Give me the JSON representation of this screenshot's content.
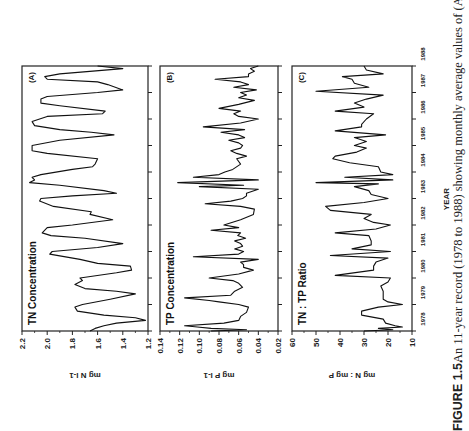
{
  "figure": {
    "caption_label": "FIGURE 1.5.",
    "caption_text": "An 11-year record (1978 to 1988) showing monthly average values of (A)",
    "x_axis_title": "YEAR"
  },
  "chart_data": [
    {
      "type": "line",
      "panel": "(A)",
      "title": "TN Concentration",
      "xlabel": "YEAR",
      "ylabel": "mg N l-1",
      "ylim": [
        1.2,
        2.2
      ],
      "yticks": [
        "1.2",
        "1.4",
        "1.6",
        "1.8",
        "2.0",
        "2.2"
      ],
      "xticks": [
        "1978",
        "1979",
        "1980",
        "1981",
        "1982",
        "1983",
        "1984",
        "1985",
        "1986",
        "1987",
        "1988"
      ],
      "grid": false,
      "x": [
        1978.0,
        1978.1,
        1978.2,
        1978.3,
        1978.4,
        1978.5,
        1978.6,
        1978.75,
        1978.9,
        1979.0,
        1979.2,
        1979.4,
        1979.5,
        1979.6,
        1979.75,
        1979.9,
        1980.0,
        1980.2,
        1980.3,
        1980.45,
        1980.55,
        1980.7,
        1980.9,
        1981.0,
        1981.15,
        1981.3,
        1981.5,
        1981.6,
        1981.7,
        1981.9,
        1982.0,
        1982.2,
        1982.4,
        1982.5,
        1982.7,
        1982.9,
        1983.0,
        1983.1,
        1983.2,
        1983.3,
        1983.5,
        1983.6,
        1983.7,
        1983.8,
        1983.9,
        1984.1,
        1984.2,
        1984.3,
        1984.5,
        1984.7,
        1984.8,
        1985.0,
        1985.2,
        1985.4,
        1985.5,
        1985.6,
        1985.75,
        1985.9,
        1986.1,
        1986.2,
        1986.3,
        1986.5,
        1986.6,
        1986.75,
        1986.85,
        1987.0,
        1987.1,
        1987.3,
        1987.4,
        1987.5,
        1987.6,
        1987.7,
        1987.9,
        1988.0
      ],
      "values": [
        1.66,
        1.62,
        1.55,
        1.45,
        1.22,
        1.3,
        1.55,
        1.76,
        1.78,
        1.72,
        1.5,
        1.3,
        1.45,
        1.7,
        1.78,
        1.72,
        1.74,
        1.45,
        1.33,
        1.34,
        1.6,
        1.74,
        1.98,
        1.96,
        1.6,
        1.4,
        1.7,
        1.97,
        2.04,
        2.0,
        1.8,
        1.48,
        1.66,
        1.65,
        1.95,
        2.06,
        2.05,
        1.8,
        1.45,
        1.55,
        1.9,
        2.14,
        2.1,
        2.12,
        2.05,
        1.8,
        1.64,
        1.62,
        1.6,
        2.0,
        2.12,
        2.12,
        1.9,
        1.47,
        1.65,
        1.9,
        2.1,
        2.12,
        2.0,
        1.56,
        1.54,
        1.9,
        2.05,
        2.05,
        2.0,
        1.6,
        1.4,
        1.52,
        1.6,
        2.0,
        2.02,
        1.9,
        1.4,
        1.6
      ]
    },
    {
      "type": "line",
      "panel": "(B)",
      "title": "TP Concentration",
      "xlabel": "YEAR",
      "ylabel": "mg P l-1",
      "ylim": [
        0.02,
        0.14
      ],
      "yticks": [
        "0.02",
        "0.04",
        "0.06",
        "0.08",
        "0.10",
        "0.12",
        "0.14"
      ],
      "xticks": [
        "1978",
        "1979",
        "1980",
        "1981",
        "1982",
        "1983",
        "1984",
        "1985",
        "1986",
        "1987",
        "1988"
      ],
      "grid": false,
      "x": [
        1978.0,
        1978.05,
        1978.1,
        1978.15,
        1978.2,
        1978.3,
        1978.4,
        1978.55,
        1978.7,
        1978.9,
        1979.0,
        1979.1,
        1979.15,
        1979.25,
        1979.35,
        1979.5,
        1979.65,
        1979.8,
        1979.9,
        1980.0,
        1980.15,
        1980.3,
        1980.4,
        1980.5,
        1980.6,
        1980.7,
        1980.8,
        1980.9,
        1981.0,
        1981.1,
        1981.2,
        1981.3,
        1981.4,
        1981.5,
        1981.6,
        1981.7,
        1981.8,
        1981.9,
        1982.0,
        1982.2,
        1982.4,
        1982.6,
        1982.7,
        1982.8,
        1982.9,
        1983.0,
        1983.1,
        1983.2,
        1983.35,
        1983.45,
        1983.5,
        1983.6,
        1983.7,
        1983.8,
        1983.9,
        1984.0,
        1984.1,
        1984.3,
        1984.5,
        1984.6,
        1984.7,
        1984.8,
        1984.9,
        1985.0,
        1985.1,
        1985.2,
        1985.3,
        1985.4,
        1985.5,
        1985.6,
        1985.7,
        1985.85,
        1986.0,
        1986.1,
        1986.2,
        1986.3,
        1986.4,
        1986.55,
        1986.7,
        1986.8,
        1986.9,
        1987.0,
        1987.1,
        1987.2,
        1987.3,
        1987.4,
        1987.5,
        1987.6,
        1987.7,
        1987.8,
        1987.9,
        1988.0
      ],
      "values": [
        0.088,
        0.052,
        0.088,
        0.102,
        0.115,
        0.075,
        0.06,
        0.058,
        0.052,
        0.05,
        0.06,
        0.08,
        0.09,
        0.115,
        0.068,
        0.064,
        0.056,
        0.06,
        0.066,
        0.09,
        0.06,
        0.045,
        0.055,
        0.055,
        0.058,
        0.04,
        0.106,
        0.06,
        0.055,
        0.064,
        0.056,
        0.058,
        0.064,
        0.053,
        0.061,
        0.058,
        0.088,
        0.06,
        0.075,
        0.058,
        0.045,
        0.044,
        0.058,
        0.094,
        0.068,
        0.056,
        0.052,
        0.052,
        0.04,
        0.1,
        0.055,
        0.122,
        0.04,
        0.106,
        0.08,
        0.074,
        0.066,
        0.058,
        0.062,
        0.052,
        0.062,
        0.068,
        0.058,
        0.056,
        0.06,
        0.07,
        0.054,
        0.06,
        0.078,
        0.054,
        0.096,
        0.058,
        0.04,
        0.06,
        0.065,
        0.058,
        0.08,
        0.06,
        0.044,
        0.06,
        0.052,
        0.058,
        0.042,
        0.065,
        0.05,
        0.058,
        0.084,
        0.05,
        0.05,
        0.044,
        0.048,
        0.04
      ]
    },
    {
      "type": "line",
      "panel": "(C)",
      "title": "TN : TP Ratio",
      "xlabel": "YEAR",
      "ylabel": "mg N : mg P",
      "ylim": [
        10,
        60
      ],
      "yticks": [
        "10",
        "20",
        "30",
        "40",
        "50",
        "60"
      ],
      "xticks": [
        "1978",
        "1979",
        "1980",
        "1981",
        "1982",
        "1983",
        "1984",
        "1985",
        "1986",
        "1987",
        "1988"
      ],
      "grid": false,
      "x": [
        1978.0,
        1978.05,
        1978.1,
        1978.15,
        1978.2,
        1978.3,
        1978.45,
        1978.6,
        1978.75,
        1978.9,
        1979.0,
        1979.1,
        1979.2,
        1979.35,
        1979.5,
        1979.7,
        1979.85,
        1980.0,
        1980.1,
        1980.3,
        1980.45,
        1980.6,
        1980.75,
        1980.85,
        1981.0,
        1981.1,
        1981.25,
        1981.4,
        1981.6,
        1981.7,
        1981.85,
        1982.0,
        1982.1,
        1982.25,
        1982.4,
        1982.55,
        1982.7,
        1982.85,
        1983.0,
        1983.15,
        1983.3,
        1983.45,
        1983.55,
        1983.6,
        1983.7,
        1983.8,
        1983.9,
        1984.0,
        1984.2,
        1984.35,
        1984.5,
        1984.6,
        1984.75,
        1984.9,
        1985.0,
        1985.15,
        1985.3,
        1985.4,
        1985.55,
        1985.7,
        1985.8,
        1986.0,
        1986.2,
        1986.3,
        1986.45,
        1986.6,
        1986.75,
        1986.9,
        1987.05,
        1987.2,
        1987.35,
        1987.5,
        1987.6,
        1987.7,
        1987.85,
        1988.0
      ],
      "values": [
        30,
        18,
        24,
        14,
        17,
        21,
        22,
        31,
        31,
        24,
        14,
        20,
        22,
        22,
        22,
        23,
        20,
        19,
        42,
        26,
        26,
        25,
        20,
        44,
        19,
        35,
        27,
        27,
        28,
        42,
        25,
        19,
        26,
        30,
        27,
        44,
        46,
        30,
        20,
        27,
        28,
        34,
        24,
        50,
        18,
        38,
        18,
        23,
        24,
        36,
        43,
        42,
        33,
        29,
        34,
        29,
        34,
        21,
        42,
        31,
        31,
        29,
        26,
        42,
        30,
        34,
        29,
        22,
        50,
        28,
        34,
        35,
        39,
        22,
        29,
        30
      ]
    }
  ]
}
